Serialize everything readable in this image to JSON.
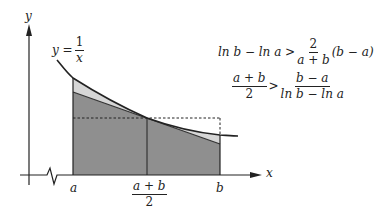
{
  "diagram": {
    "type": "function-area-illustration",
    "axes": {
      "x_label": "x",
      "y_label": "y",
      "x_axis_break": true
    },
    "curve_label": {
      "lhs": "y =",
      "numerator": "1",
      "denominator": "x"
    },
    "x_ticks": {
      "a": "a",
      "mid_numerator": "a + b",
      "mid_denominator": "2",
      "b": "b"
    },
    "inequality_1": {
      "lhs": "ln b − ln a >",
      "frac_numerator": "2",
      "frac_denominator": "a + b",
      "rhs": "(b − a)"
    },
    "inequality_2": {
      "frac1_numerator": "a + b",
      "frac1_denominator": "2",
      "operator": ">",
      "frac2_numerator": "b − a",
      "frac2_denominator": "ln b − ln a"
    },
    "colors": {
      "dark_fill": "#8f8f8f",
      "light_fill": "#d6d6d6",
      "stroke": "#222222",
      "background": "#ffffff"
    }
  }
}
